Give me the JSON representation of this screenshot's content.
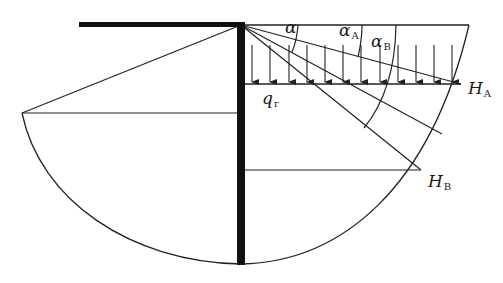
{
  "figure": {
    "type": "retaining-wall earth pressure diagram",
    "colors": {
      "line": "#222222",
      "wall": "#111111",
      "background": "#ffffff"
    },
    "labels": {
      "alpha": {
        "main": "α",
        "sub": ""
      },
      "alpha_A": {
        "main": "α",
        "sub": "A"
      },
      "alpha_B": {
        "main": "α",
        "sub": "B"
      },
      "q": {
        "main": "q",
        "sub": "г"
      },
      "H_A": {
        "main": "H",
        "sub": "A"
      },
      "H_B": {
        "main": "H",
        "sub": "B"
      }
    },
    "load_arrow_count": 12
  }
}
